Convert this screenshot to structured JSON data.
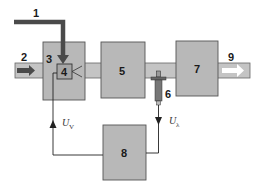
{
  "diagram": {
    "type": "block-diagram",
    "colors": {
      "block_fill": "#b8b8b8",
      "block_stroke": "#555555",
      "pipe_fill": "#c4c4c4",
      "arrow_dark": "#4a4a4a",
      "line": "#222222",
      "background": "#ffffff"
    },
    "labels": {
      "n1": "1",
      "n2": "2",
      "n3": "3",
      "n4": "4",
      "n5": "5",
      "n6": "6",
      "n7": "7",
      "n8": "8",
      "n9": "9"
    },
    "signals": {
      "uv_main": "U",
      "uv_sub": "V",
      "ul_main": "U",
      "ul_sub": "λ"
    },
    "nodes": [
      {
        "id": "1",
        "desc": "input arrow entering block 4 from above"
      },
      {
        "id": "2",
        "desc": "inlet flow arrow (left)"
      },
      {
        "id": "3",
        "desc": "first block containing component 4"
      },
      {
        "id": "4",
        "desc": "inner component with spray/valve"
      },
      {
        "id": "5",
        "desc": "middle block"
      },
      {
        "id": "6",
        "desc": "probe/sensor in pipe"
      },
      {
        "id": "7",
        "desc": "right block"
      },
      {
        "id": "8",
        "desc": "control unit (bottom)"
      },
      {
        "id": "9",
        "desc": "outlet flow arrow (right)"
      }
    ],
    "connections": [
      {
        "from": "1",
        "to": "4"
      },
      {
        "from": "2",
        "to": "3"
      },
      {
        "from": "3",
        "to": "5"
      },
      {
        "from": "5",
        "to": "7"
      },
      {
        "from": "7",
        "to": "9"
      },
      {
        "from": "6",
        "to": "8",
        "signal": "Uλ"
      },
      {
        "from": "8",
        "to": "4",
        "signal": "UV"
      }
    ]
  }
}
